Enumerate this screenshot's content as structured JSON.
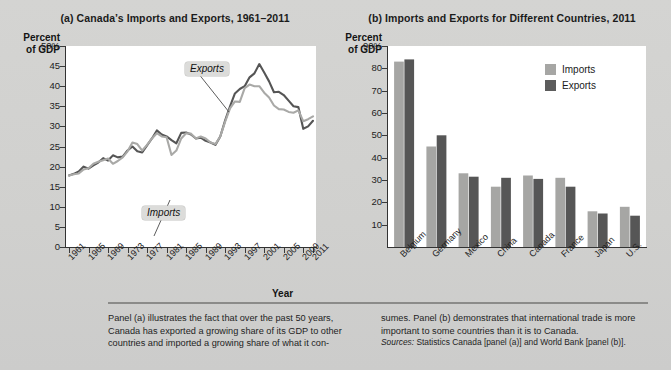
{
  "figure": {
    "panel_a_title": "(a) Canada’s Imports and Exports, 1961–2011",
    "panel_b_title": "(b) Imports and Exports for Different Countries, 2011",
    "y_axis_caption": "Percent\nof GDP",
    "x_axis_name": "Year",
    "callout_exports": "Exports",
    "callout_imports": "Imports",
    "legend": [
      {
        "label": "Imports",
        "color": "#a6a6a4"
      },
      {
        "label": "Exports",
        "color": "#5c5c5c"
      }
    ],
    "caption_left": "Panel (a) illustrates the fact that over the past 50 years, Canada has exported a growing share of its GDP to other countries and imported a growing share of what it con-",
    "caption_right": "sumes. Panel (b) demonstrates that international trade is more important to some countries than it is to Canada.",
    "sources_label": "Sources:",
    "sources_text": " Statistics Canada [panel (a)] and World Bank [panel (b)]."
  },
  "chart_data": [
    {
      "type": "line",
      "title": "(a) Canada’s Imports and Exports, 1961–2011",
      "xlabel": "Year",
      "ylabel": "Percent of GDP",
      "ylim": [
        0,
        50
      ],
      "yticks": [
        0,
        5,
        10,
        15,
        20,
        25,
        30,
        35,
        40,
        45,
        50
      ],
      "ytick_labels": [
        "0",
        "5",
        "10",
        "15",
        "20",
        "25",
        "30",
        "35",
        "40",
        "45",
        "50%"
      ],
      "xlim": [
        1961,
        2011
      ],
      "xticks": [
        1961,
        1965,
        1969,
        1973,
        1977,
        1981,
        1985,
        1989,
        1993,
        1997,
        2001,
        2005,
        2009,
        2011
      ],
      "xtick_labels": [
        "1961",
        "1965",
        "1969",
        "1973",
        "1977",
        "1981",
        "1985",
        "1989",
        "1993",
        "1997",
        "2001",
        "2005",
        "2009",
        "2011"
      ],
      "grid": false,
      "legend_position": "annotated-callouts",
      "x": [
        1961,
        1962,
        1963,
        1964,
        1965,
        1966,
        1967,
        1968,
        1969,
        1970,
        1971,
        1972,
        1973,
        1974,
        1975,
        1976,
        1977,
        1978,
        1979,
        1980,
        1981,
        1982,
        1983,
        1984,
        1985,
        1986,
        1987,
        1988,
        1989,
        1990,
        1991,
        1992,
        1993,
        1994,
        1995,
        1996,
        1997,
        1998,
        1999,
        2000,
        2001,
        2002,
        2003,
        2004,
        2005,
        2006,
        2007,
        2008,
        2009,
        2010,
        2011
      ],
      "series": [
        {
          "name": "Exports",
          "color": "#555555",
          "values": [
            17.8,
            18.2,
            18.8,
            20.0,
            19.5,
            20.3,
            21.0,
            22.1,
            21.5,
            22.8,
            22.3,
            22.5,
            24.0,
            25.0,
            23.8,
            23.5,
            25.3,
            27.0,
            29.0,
            28.0,
            27.5,
            26.6,
            25.8,
            28.4,
            28.5,
            28.0,
            27.0,
            27.2,
            26.4,
            26.0,
            25.4,
            27.5,
            31.5,
            35.0,
            38.2,
            39.3,
            40.0,
            42.2,
            43.2,
            45.5,
            43.4,
            41.2,
            38.5,
            38.6,
            37.8,
            36.4,
            35.0,
            34.8,
            29.4,
            30.0,
            31.4
          ]
        },
        {
          "name": "Imports",
          "color": "#a9a9a7",
          "values": [
            17.8,
            18.1,
            18.3,
            19.3,
            19.6,
            20.7,
            21.2,
            21.6,
            22.0,
            20.7,
            21.4,
            22.3,
            23.8,
            26.0,
            25.6,
            24.0,
            25.4,
            27.0,
            28.3,
            27.5,
            27.3,
            22.9,
            24.0,
            27.0,
            28.3,
            28.2,
            27.0,
            27.5,
            27.0,
            26.0,
            25.6,
            27.5,
            31.2,
            34.5,
            36.2,
            36.1,
            39.5,
            40.4,
            40.0,
            40.0,
            38.4,
            37.2,
            35.2,
            34.3,
            34.2,
            33.6,
            33.4,
            34.0,
            31.3,
            31.8,
            32.5
          ]
        }
      ]
    },
    {
      "type": "bar",
      "title": "(b) Imports and Exports for Different Countries, 2011",
      "xlabel": "",
      "ylabel": "Percent of GDP",
      "ylim": [
        0,
        90
      ],
      "yticks": [
        10,
        20,
        30,
        40,
        50,
        60,
        70,
        80,
        90
      ],
      "ytick_labels": [
        "10",
        "20",
        "30",
        "40",
        "50",
        "60",
        "70",
        "80",
        "90%"
      ],
      "grid": false,
      "legend_position": "upper-right",
      "categories": [
        "Belgium",
        "Germany",
        "Mexico",
        "China",
        "Canada",
        "France",
        "Japan",
        "U.S."
      ],
      "series": [
        {
          "name": "Imports",
          "color": "#a6a6a4",
          "values": [
            83,
            45,
            33,
            27,
            32,
            31,
            16,
            18
          ]
        },
        {
          "name": "Exports",
          "color": "#565656",
          "values": [
            84,
            50,
            31.5,
            31,
            30.5,
            27,
            15,
            14
          ]
        }
      ]
    }
  ]
}
